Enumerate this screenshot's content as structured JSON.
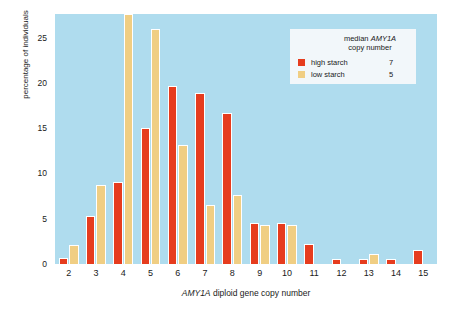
{
  "chart_data": {
    "type": "bar",
    "title": "",
    "xlabel": "AMY1A diploid gene copy number",
    "xlabel_italic_prefix": "AMY1A",
    "xlabel_rest": " diploid gene copy number",
    "ylabel": "percentage of individuals",
    "categories": [
      "2",
      "3",
      "4",
      "5",
      "6",
      "7",
      "8",
      "9",
      "10",
      "11",
      "12",
      "13",
      "14",
      "15"
    ],
    "ylim": [
      0,
      27.6
    ],
    "yticks": [
      0,
      5,
      10,
      15,
      20,
      25
    ],
    "grid": false,
    "legend_position": "top-right",
    "note": "low starch bar at copy number 4 is clipped by the top of the plot area",
    "series": [
      {
        "name": "high starch",
        "color": "#e63c1e",
        "median_copy_number": "7",
        "values": [
          0.7,
          5.3,
          9.1,
          15.0,
          19.7,
          18.9,
          16.7,
          4.5,
          4.5,
          2.2,
          0.6,
          0.6,
          0.6,
          1.5
        ]
      },
      {
        "name": "low starch",
        "color": "#f0ce83",
        "median_copy_number": "5",
        "values": [
          2.1,
          8.7,
          27.6,
          25.9,
          13.1,
          6.5,
          7.6,
          4.3,
          4.3,
          0,
          0,
          1.1,
          0,
          0
        ]
      }
    ]
  },
  "legend": {
    "title_line1_prefix": "median ",
    "title_line1_italic": "AMY1A",
    "title_line2": "copy number",
    "rows": [
      {
        "label": "high starch",
        "value": "7"
      },
      {
        "label": "low starch",
        "value": "5"
      }
    ]
  },
  "colors": {
    "plot_background": "#afdcee",
    "high_starch": "#e63c1e",
    "low_starch": "#f0ce83",
    "legend_background": "#f2f7fa",
    "page_background": "#ffffff",
    "text": "#1a1a1a"
  }
}
